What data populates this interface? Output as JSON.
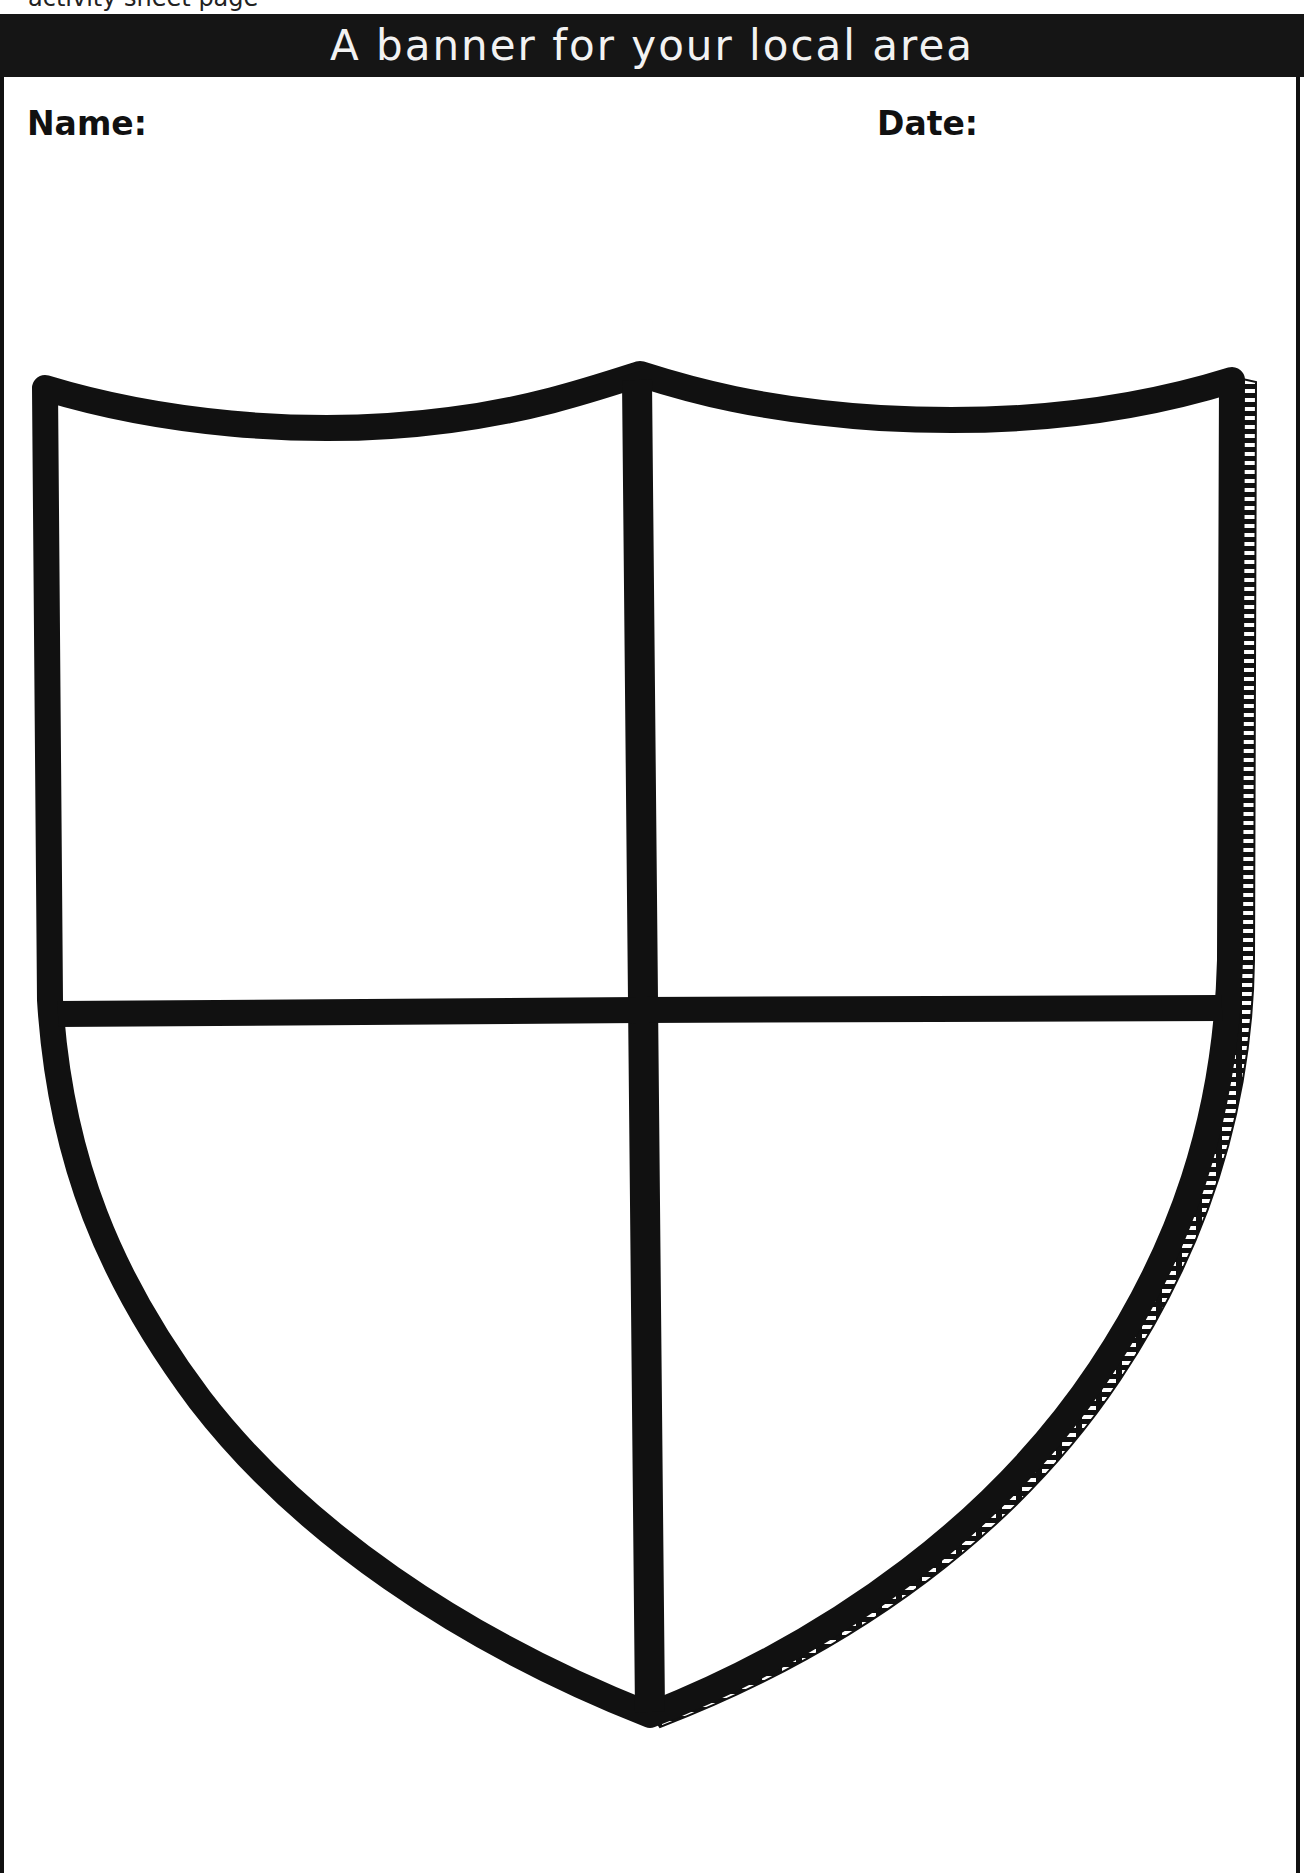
{
  "page": {
    "cropped_top_text": "activity sheet page"
  },
  "header": {
    "title": "A banner for your local area"
  },
  "fields": {
    "name_label": "Name:",
    "date_label": "Date:"
  },
  "shield": {
    "description": "Blank heraldic shield divided into four quarters",
    "quarters": [
      "top-left",
      "top-right",
      "bottom-left",
      "bottom-right"
    ],
    "stroke_color": "#111111",
    "fill_color": "#ffffff"
  }
}
